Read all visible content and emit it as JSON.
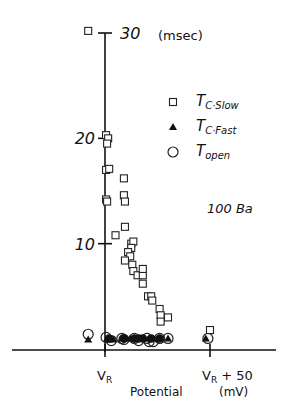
{
  "chart_data": {
    "type": "scatter",
    "title": "",
    "annotation": "100 Ba",
    "xlabel": "Potential",
    "xunit": "(mV)",
    "ylabel": "",
    "yunit": "(msec)",
    "x_ticks": [
      {
        "label": "V_R",
        "value": 0
      },
      {
        "label": "V_R + 50",
        "value": 50
      }
    ],
    "y_ticks": [
      {
        "label": "10",
        "value": 10
      },
      {
        "label": "20",
        "value": 20
      },
      {
        "label": "30",
        "value": 30
      }
    ],
    "xlim": [
      -7,
      60
    ],
    "ylim": [
      0,
      30
    ],
    "grid": false,
    "legend_position": "upper right",
    "legend": [
      {
        "name": "T_C·Slow",
        "marker": "open-square"
      },
      {
        "name": "T_C·Fast",
        "marker": "filled-triangle"
      },
      {
        "name": "T_open",
        "marker": "open-circle"
      }
    ],
    "series": [
      {
        "name": "T_C·Slow",
        "marker": "open-square",
        "points": [
          [
            -8,
            30.2
          ],
          [
            0.5,
            20.3
          ],
          [
            1.5,
            20.0
          ],
          [
            1,
            19.5
          ],
          [
            0.5,
            17.0
          ],
          [
            2,
            17.1
          ],
          [
            0.5,
            14.2
          ],
          [
            1,
            14.0
          ],
          [
            9,
            16.2
          ],
          [
            9,
            14.6
          ],
          [
            9.5,
            14.0
          ],
          [
            5,
            10.8
          ],
          [
            9.5,
            11.6
          ],
          [
            12.5,
            10.0
          ],
          [
            13.5,
            10.2
          ],
          [
            12.5,
            9.6
          ],
          [
            11,
            9.2
          ],
          [
            12,
            8.8
          ],
          [
            9.5,
            8.4
          ],
          [
            13,
            8.0
          ],
          [
            13.5,
            7.4
          ],
          [
            15.5,
            7.0
          ],
          [
            18,
            7.0
          ],
          [
            18,
            7.6
          ],
          [
            18,
            6.2
          ],
          [
            20.5,
            5.0
          ],
          [
            22,
            5.0
          ],
          [
            22.5,
            4.6
          ],
          [
            26,
            3.8
          ],
          [
            26.5,
            3.2
          ],
          [
            26.5,
            2.6
          ],
          [
            30,
            3.0
          ],
          [
            50,
            1.8
          ]
        ]
      },
      {
        "name": "T_C·Fast",
        "marker": "filled-triangle",
        "points": [
          [
            -8,
            0.9
          ],
          [
            1,
            1.0
          ],
          [
            2,
            0.9
          ],
          [
            4,
            0.9
          ],
          [
            8,
            1.0
          ],
          [
            10,
            1.0
          ],
          [
            12,
            1.0
          ],
          [
            14,
            1.0
          ],
          [
            16,
            1.0
          ],
          [
            17,
            1.0
          ],
          [
            19,
            1.0
          ],
          [
            21,
            1.0
          ],
          [
            23,
            1.0
          ],
          [
            26,
            1.0
          ],
          [
            30,
            1.0
          ],
          [
            48,
            1.0
          ]
        ]
      },
      {
        "name": "T_open",
        "marker": "open-circle",
        "points": [
          [
            -8,
            1.4
          ],
          [
            0.5,
            1.1
          ],
          [
            3,
            0.8
          ],
          [
            8,
            1.0
          ],
          [
            9,
            0.9
          ],
          [
            14,
            1.0
          ],
          [
            16,
            0.8
          ],
          [
            20,
            1.0
          ],
          [
            21,
            0.7
          ],
          [
            23,
            0.7
          ],
          [
            26,
            1.0
          ],
          [
            30,
            1.0
          ],
          [
            49,
            1.0
          ]
        ]
      }
    ]
  }
}
